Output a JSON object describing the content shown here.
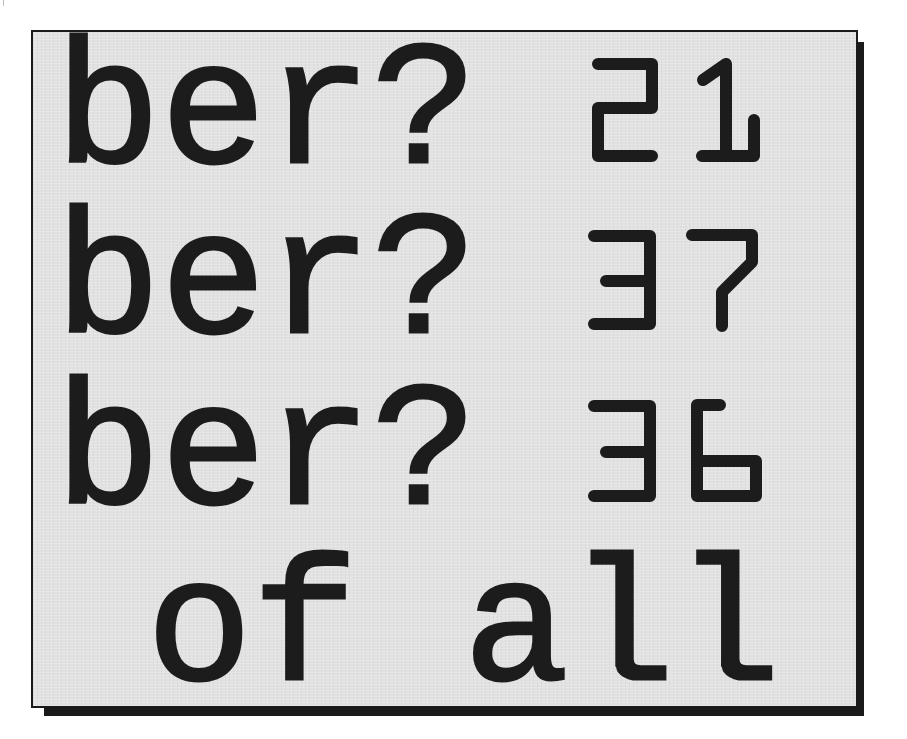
{
  "panel": {
    "background_color": "#e2e2e2",
    "border_color": "#1a1a1a",
    "text_color": "#1c1c1c"
  },
  "lines": [
    {
      "text": "ber?",
      "number": "21"
    },
    {
      "text": "ber?",
      "number": "37"
    },
    {
      "text": "ber?",
      "number": "36"
    },
    {
      "text": " of all"
    }
  ]
}
